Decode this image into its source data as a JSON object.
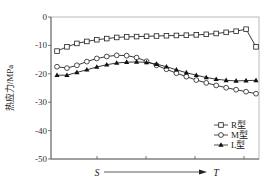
{
  "chart_data": {
    "type": "line",
    "title": "",
    "xlabel": "S → T",
    "ylabel": "热应力/MPa",
    "ylim": [
      -50,
      0
    ],
    "yticks": [
      0,
      -10,
      -20,
      -30,
      -40,
      -50
    ],
    "ytick_labels": [
      "0",
      "-10",
      "-20",
      "-30",
      "-40",
      "-50"
    ],
    "x_annotations": [
      {
        "label": "S",
        "position": "first tick"
      },
      {
        "label": "T",
        "position": "arrow end"
      }
    ],
    "grid": false,
    "legend_position": "lower right",
    "x": [
      0,
      1,
      2,
      3,
      4,
      5,
      6,
      7,
      8,
      9,
      10,
      11,
      12,
      13,
      14,
      15,
      16,
      17,
      18,
      19,
      20
    ],
    "series": [
      {
        "name": "R型",
        "marker": "square-open",
        "values": [
          -12,
          -10.5,
          -9.3,
          -8.6,
          -8,
          -7.6,
          -7.2,
          -7,
          -6.9,
          -6.8,
          -6.7,
          -6.6,
          -6.5,
          -6.4,
          -6.3,
          -6.1,
          -5.8,
          -5.4,
          -5,
          -4.3,
          -10.5
        ]
      },
      {
        "name": "M型",
        "marker": "circle-open",
        "values": [
          -17.5,
          -18,
          -17,
          -15.7,
          -14.6,
          -13.9,
          -13.5,
          -13.6,
          -14.3,
          -15.6,
          -17,
          -18.4,
          -19.8,
          -21,
          -22.2,
          -23.2,
          -24.1,
          -24.9,
          -25.6,
          -26.3,
          -27
        ]
      },
      {
        "name": "L型",
        "marker": "triangle-filled",
        "values": [
          -20.5,
          -20.5,
          -19.5,
          -18.6,
          -17.6,
          -16.8,
          -16.2,
          -15.9,
          -15.8,
          -16,
          -16.6,
          -17.5,
          -18.6,
          -19.6,
          -20.5,
          -21.3,
          -21.9,
          -22.3,
          -22.5,
          -22.4,
          -22.3
        ]
      }
    ]
  },
  "axes": {
    "ylabel": "热应力/MPa",
    "y_ticks": [
      "0",
      "-10",
      "-20",
      "-30",
      "-40",
      "-50"
    ],
    "x_start_label": "S",
    "x_end_label": "T"
  },
  "legend": {
    "items": [
      {
        "label": "R型",
        "marker": "square-open"
      },
      {
        "label": "M型",
        "marker": "circle-open"
      },
      {
        "label": "L型",
        "marker": "triangle-filled"
      }
    ]
  },
  "colors": {
    "line": "#222222",
    "axis": "#555555",
    "frame": "#999999"
  }
}
